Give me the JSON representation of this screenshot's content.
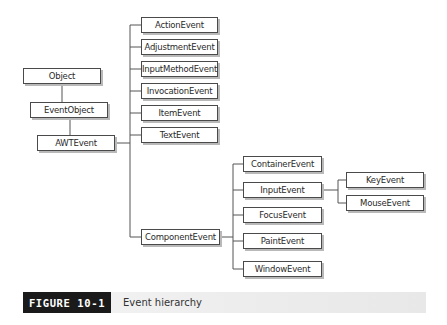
{
  "diagram": {
    "title": "Event hierarchy",
    "nodes": {
      "object": "Object",
      "event_object": "EventObject",
      "awt_event": "AWTEvent",
      "action_event": "ActionEvent",
      "adjustment_event": "AdjustmentEvent",
      "input_method_event": "InputMethodEvent",
      "invocation_event": "InvocationEvent",
      "item_event": "ItemEvent",
      "text_event": "TextEvent",
      "component_event": "ComponentEvent",
      "container_event": "ContainerEvent",
      "input_event": "InputEvent",
      "focus_event": "FocusEvent",
      "paint_event": "PaintEvent",
      "window_event": "WindowEvent",
      "key_event": "KeyEvent",
      "mouse_event": "MouseEvent"
    },
    "edges": [
      [
        "Object",
        "EventObject"
      ],
      [
        "EventObject",
        "AWTEvent"
      ],
      [
        "AWTEvent",
        "ActionEvent"
      ],
      [
        "AWTEvent",
        "AdjustmentEvent"
      ],
      [
        "AWTEvent",
        "InputMethodEvent"
      ],
      [
        "AWTEvent",
        "InvocationEvent"
      ],
      [
        "AWTEvent",
        "ItemEvent"
      ],
      [
        "AWTEvent",
        "TextEvent"
      ],
      [
        "AWTEvent",
        "ComponentEvent"
      ],
      [
        "ComponentEvent",
        "ContainerEvent"
      ],
      [
        "ComponentEvent",
        "InputEvent"
      ],
      [
        "ComponentEvent",
        "FocusEvent"
      ],
      [
        "ComponentEvent",
        "PaintEvent"
      ],
      [
        "ComponentEvent",
        "WindowEvent"
      ],
      [
        "InputEvent",
        "KeyEvent"
      ],
      [
        "InputEvent",
        "MouseEvent"
      ]
    ]
  },
  "caption": {
    "label": "FIGURE 10-1",
    "text": "Event hierarchy"
  },
  "colors": {
    "line": "#4a4a4a",
    "box_border": "#4a4a4a",
    "box_shadow": "#b9b9b9",
    "caption_label_bg": "#1a1a1a"
  }
}
